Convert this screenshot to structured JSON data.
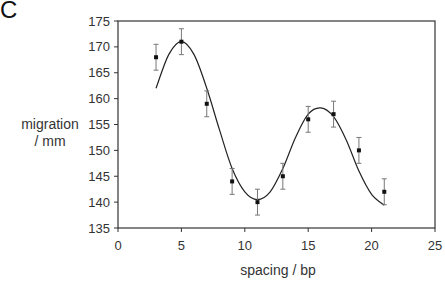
{
  "panel_label": "C",
  "chart_data": {
    "type": "scatter",
    "title": "",
    "xlabel": "spacing / bp",
    "ylabel": "migration / mm",
    "ylabel_lines": [
      "migration",
      "/ mm"
    ],
    "xlim": [
      0,
      25
    ],
    "ylim": [
      135,
      175
    ],
    "xticks": [
      0,
      5,
      10,
      15,
      20,
      25
    ],
    "yticks": [
      135,
      140,
      145,
      150,
      155,
      160,
      165,
      170,
      175
    ],
    "grid": false,
    "legend": null,
    "series": [
      {
        "name": "measured",
        "type": "scatter",
        "x": [
          3,
          5,
          7,
          9,
          11,
          13,
          15,
          17,
          19,
          21
        ],
        "y": [
          168,
          171,
          159,
          144,
          140,
          145,
          156,
          157,
          150,
          142
        ],
        "error": [
          2.5,
          2.5,
          2.5,
          2.5,
          2.5,
          2.5,
          2.5,
          2.5,
          2.5,
          2.5
        ]
      },
      {
        "name": "fit",
        "type": "line",
        "x": [
          3,
          4,
          5,
          6,
          7,
          8,
          9,
          10,
          11,
          12,
          13,
          14,
          15,
          16,
          17,
          18,
          19,
          20,
          21
        ],
        "y": [
          162,
          168.5,
          171,
          168.5,
          162,
          154,
          146.5,
          142,
          140.5,
          142,
          146.5,
          152.5,
          157,
          158.2,
          156.5,
          152,
          146,
          141.5,
          139.4
        ]
      }
    ]
  }
}
